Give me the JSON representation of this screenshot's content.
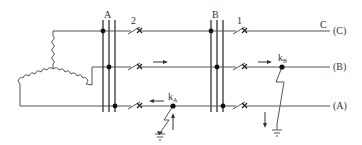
{
  "diagram": {
    "type": "power-system single-line ground-fault schematic",
    "buses": [
      {
        "label": "A"
      },
      {
        "label": "B"
      }
    ],
    "breakers": [
      {
        "label": "2",
        "line": "C"
      },
      {
        "label": "1",
        "line": "C"
      }
    ],
    "lines": [
      {
        "end_label": "(C)",
        "phase_label": "C"
      },
      {
        "end_label": "(B)"
      },
      {
        "end_label": "(A)"
      }
    ],
    "faults": [
      {
        "label": "k",
        "subscript": "A",
        "phase": "A"
      },
      {
        "label": "k",
        "subscript": "B",
        "phase": "B"
      }
    ],
    "generator": {
      "connection": "wye"
    },
    "colors": {
      "line": "#555555",
      "dot": "#111111",
      "background": "#ffffff"
    }
  }
}
